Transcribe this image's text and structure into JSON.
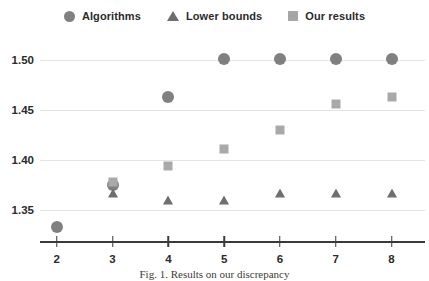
{
  "chart_data": {
    "type": "scatter",
    "title": "",
    "xlabel": "",
    "ylabel": "",
    "x": [
      2,
      3,
      4,
      5,
      6,
      7,
      8
    ],
    "xlim": [
      1.7,
      8.6
    ],
    "ylim": [
      1.32,
      1.52
    ],
    "yticks": [
      1.35,
      1.4,
      1.45,
      1.5
    ],
    "ytick_labels": [
      "1.35",
      "1.40",
      "1.45",
      "1.50"
    ],
    "xtick_labels": [
      "2",
      "3",
      "4",
      "5",
      "6",
      "7",
      "8"
    ],
    "grid": true,
    "legend_position": "top-center",
    "series": [
      {
        "name": "Algorithms",
        "marker": "circle",
        "color": "#808080",
        "x": [
          2,
          3,
          4,
          5,
          6,
          7,
          8
        ],
        "values": [
          1.333,
          1.375,
          1.463,
          1.501,
          1.501,
          1.501,
          1.501
        ]
      },
      {
        "name": "Lower bounds",
        "marker": "triangle",
        "color": "#6e6e6e",
        "x": [
          3,
          4,
          5,
          6,
          7,
          8
        ],
        "values": [
          1.367,
          1.36,
          1.36,
          1.367,
          1.367,
          1.367
        ]
      },
      {
        "name": "Our results",
        "marker": "square",
        "color": "#a9a9a9",
        "x": [
          3,
          4,
          5,
          6,
          7,
          8
        ],
        "values": [
          1.378,
          1.394,
          1.411,
          1.43,
          1.456,
          1.463
        ]
      }
    ]
  },
  "legend": {
    "items": [
      {
        "label": "Algorithms",
        "marker": "circle-marker"
      },
      {
        "label": "Lower bounds",
        "marker": "triangle-marker"
      },
      {
        "label": "Our results",
        "marker": "square-marker"
      }
    ]
  },
  "caption": {
    "text": "Fig. 1. Results on our discrepancy"
  }
}
